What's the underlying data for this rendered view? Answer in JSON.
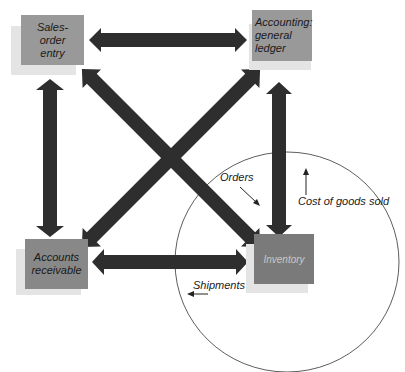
{
  "nodes": {
    "sales_order_entry": {
      "label": "Sales-\norder\nentry",
      "color": "#999999"
    },
    "accounting_general_ledger": {
      "label": "Accounting:\ngeneral\nledger",
      "color": "#999999"
    },
    "accounts_receivable": {
      "label": "Accounts\nreceivable",
      "color": "#888888"
    },
    "inventory": {
      "label": "Inventory",
      "color": "#7a7a7a",
      "text_color": "#c8c8c8"
    }
  },
  "annotations": {
    "orders": "Orders",
    "cost_of_goods_sold": "Cost of goods sold",
    "shipments": "Shipments"
  },
  "colors": {
    "arrow": "#2e2e2e",
    "shadow": "#e4e4e4",
    "circle": "#333333"
  }
}
